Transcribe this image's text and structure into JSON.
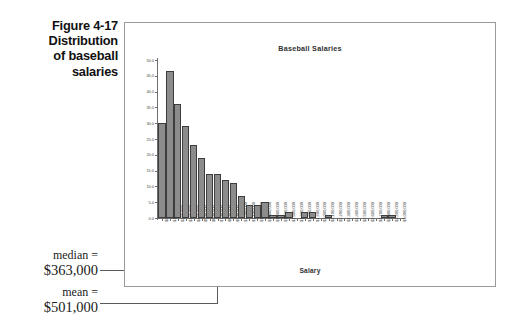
{
  "figure": {
    "caption_lines": [
      "Figure 4-17",
      "Distribution",
      "of baseball",
      "salaries"
    ]
  },
  "annotations": [
    {
      "id": "median",
      "label": "median  =",
      "value": "$363,000"
    },
    {
      "id": "mean",
      "label": "mean  =",
      "value": "$501,000"
    }
  ],
  "chart_data": {
    "type": "bar",
    "title": "Baseball Salaries",
    "xlabel": "Salary",
    "ylabel": "",
    "ylim": [
      0,
      50
    ],
    "grid": false,
    "legend": "none",
    "ytick_labels": [
      "50.0",
      "45.0",
      "40.0",
      "35.0",
      "30.0",
      "25.0",
      "20.0",
      "15.0",
      "10.0",
      "5.0",
      "0.0"
    ],
    "ytick_values": [
      50,
      45,
      40,
      35,
      30,
      25,
      20,
      15,
      10,
      5,
      0
    ],
    "categories": [
      "$0",
      "$100,000",
      "$200,000",
      "$300,000",
      "$400,000",
      "$500,000",
      "$600,000",
      "$700,000",
      "$800,000",
      "$900,000",
      "$1,000,000",
      "$1,100,000",
      "$1,200,000",
      "$1,300,000",
      "$1,400,000",
      "$1,500,000",
      "$1,600,000",
      "$1,700,000",
      "$1,800,000",
      "$1,900,000",
      "$2,000,000",
      "$2,100,000",
      "$2,200,000",
      "$2,300,000",
      "$2,400,000",
      "$2,500,000",
      "$2,600,000",
      "$2,700,000",
      "$2,800,000",
      "$2,900,000",
      "$3,000,000"
    ],
    "values": [
      30.0,
      46.5,
      36.0,
      29.0,
      23.0,
      19.0,
      14.0,
      14.0,
      12.0,
      11.0,
      7.0,
      4.0,
      4.0,
      5.0,
      1.0,
      1.0,
      2.0,
      0.0,
      2.0,
      2.0,
      0.0,
      1.0,
      0.0,
      0.0,
      0.0,
      0.0,
      0.0,
      0.0,
      1.0,
      1.0,
      0.0
    ]
  },
  "colors": {
    "bar_fill": "#8c8c8c",
    "bar_stroke": "#3d3d3d",
    "axis": "#6e6e6e",
    "frame": "#9a9a9a",
    "text": "#303030"
  }
}
